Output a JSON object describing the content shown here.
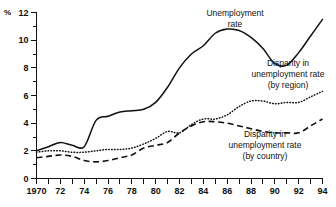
{
  "chart_data": {
    "type": "line",
    "title": "",
    "xlabel": "",
    "ylabel": "%",
    "unit_label": "%",
    "xlim": [
      1970,
      1994
    ],
    "ylim": [
      0,
      12
    ],
    "grid": false,
    "legend_position": "inline-annotations",
    "y_ticks_major": [
      0,
      2,
      4,
      6,
      8,
      10,
      12
    ],
    "y_ticks_minor": [
      1,
      3,
      5,
      7,
      9,
      11
    ],
    "y_tick_labels": [
      "0",
      "2",
      "4",
      "6",
      "8",
      "10",
      "12"
    ],
    "x_ticks": [
      1970,
      1971,
      1972,
      1973,
      1974,
      1975,
      1976,
      1977,
      1978,
      1979,
      1980,
      1981,
      1982,
      1983,
      1984,
      1985,
      1986,
      1987,
      1988,
      1989,
      1990,
      1991,
      1992,
      1993,
      1994
    ],
    "x_tick_labels": [
      "1970",
      "",
      "72",
      "",
      "74",
      "",
      "76",
      "",
      "78",
      "",
      "80",
      "",
      "82",
      "",
      "84",
      "",
      "86",
      "",
      "88",
      "",
      "90",
      "",
      "92",
      "",
      "94"
    ],
    "x": [
      1970,
      1971,
      1972,
      1973,
      1974,
      1975,
      1976,
      1977,
      1978,
      1979,
      1980,
      1981,
      1982,
      1983,
      1984,
      1985,
      1986,
      1987,
      1988,
      1989,
      1990,
      1991,
      1992,
      1993,
      1994
    ],
    "series": [
      {
        "name": "Unemployment rate",
        "style": "solid",
        "label": "Unemployment\nrate",
        "label_lines": [
          "Unemployment",
          "rate"
        ],
        "values": [
          2.0,
          2.3,
          2.6,
          2.4,
          2.3,
          4.2,
          4.5,
          4.8,
          4.9,
          5.0,
          5.5,
          6.6,
          8.0,
          9.0,
          9.6,
          10.5,
          10.8,
          10.7,
          10.2,
          9.4,
          8.3,
          8.2,
          9.1,
          10.3,
          11.5
        ]
      },
      {
        "name": "Disparity in unemployment rate (by region)",
        "style": "dotted",
        "label": "Disparity in\nunemployment rate\n(by region)",
        "label_lines": [
          "Disparity in",
          "unemployment rate",
          "(by region)"
        ],
        "values": [
          1.9,
          2.0,
          2.0,
          1.9,
          1.9,
          2.0,
          2.1,
          2.1,
          2.2,
          2.5,
          2.9,
          3.4,
          3.3,
          3.9,
          4.3,
          4.3,
          4.6,
          5.2,
          5.6,
          5.6,
          5.4,
          5.5,
          5.5,
          5.9,
          6.3
        ]
      },
      {
        "name": "Disparity in unemployment rate (by country)",
        "style": "dashed",
        "label": "Disparity in\nunemployment rate\n(by country)",
        "label_lines": [
          "Disparity in",
          "unemployment rate",
          "(by country)"
        ],
        "values": [
          1.5,
          1.6,
          1.7,
          1.6,
          1.3,
          1.2,
          1.3,
          1.5,
          1.7,
          2.2,
          2.4,
          2.6,
          3.3,
          3.8,
          4.1,
          4.1,
          4.0,
          3.8,
          3.6,
          3.4,
          3.3,
          3.3,
          3.3,
          3.8,
          4.3
        ]
      }
    ],
    "annotations": [
      {
        "name": "unemployment-rate-label",
        "lines": [
          "Unemployment",
          "rate"
        ],
        "x_px": 235,
        "y_px": 16,
        "anchor": "middle"
      },
      {
        "name": "disparity-region-label",
        "lines": [
          "Disparity in",
          "unemployment rate",
          "(by region)"
        ],
        "x_px": 288,
        "y_px": 66,
        "anchor": "middle"
      },
      {
        "name": "disparity-country-label",
        "lines": [
          "Disparity in",
          "unemployment rate",
          "(by country)"
        ],
        "x_px": 265,
        "y_px": 137,
        "anchor": "middle"
      }
    ],
    "colors": {
      "line": "#111111",
      "axis": "#111111",
      "background": "#ffffff"
    }
  }
}
